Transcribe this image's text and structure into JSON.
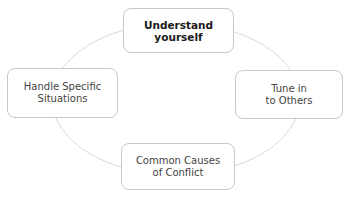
{
  "diagram": {
    "type": "cycle",
    "ring_color": "#d9d9d9",
    "border_color": "#c8c8c8",
    "nodes": [
      {
        "id": "top",
        "label": "Understand\nyourself",
        "emphasis": "bold"
      },
      {
        "id": "right",
        "label": "Tune in\nto Others",
        "emphasis": "normal"
      },
      {
        "id": "bottom",
        "label": "Common Causes\nof Conflict",
        "emphasis": "normal"
      },
      {
        "id": "left",
        "label": "Handle Specific\nSituations",
        "emphasis": "normal"
      }
    ]
  }
}
